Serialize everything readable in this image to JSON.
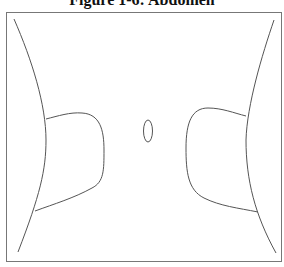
{
  "figure": {
    "title": "Figure 1-6:  Abdomen",
    "line_color": "#555555",
    "frame_color": "#777777"
  },
  "parts": [
    {
      "name": "left-flank-line"
    },
    {
      "name": "right-flank-line"
    },
    {
      "name": "left-hip-contour"
    },
    {
      "name": "right-hip-contour"
    },
    {
      "name": "navel"
    }
  ]
}
